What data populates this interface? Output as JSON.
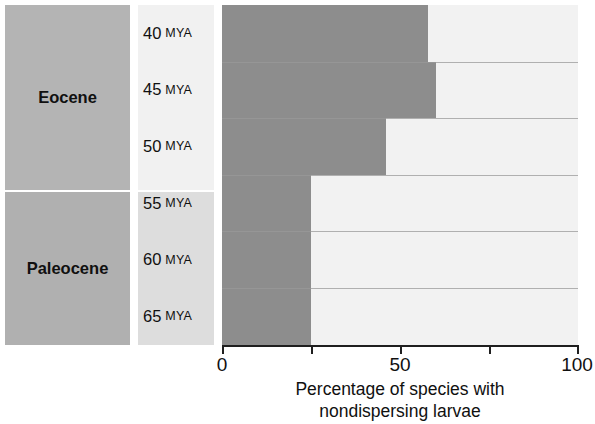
{
  "chart_data": {
    "type": "bar",
    "orientation": "horizontal",
    "title": "",
    "xlabel": "Percentage of species with nondispersing larvae",
    "xlabel_lines": [
      "Percentage of species with",
      "nondispersing larvae"
    ],
    "ylabel": "",
    "categories": [
      "40 MYA",
      "45 MYA",
      "50 MYA",
      "55 MYA",
      "60 MYA",
      "65 MYA"
    ],
    "values": [
      58,
      60,
      46,
      25,
      25,
      25
    ],
    "xlim": [
      0,
      100
    ],
    "xticks": [
      0,
      25,
      50,
      75,
      100
    ],
    "xtick_labels": [
      "0",
      "",
      "50",
      "",
      "100"
    ],
    "grid": false,
    "legend": "none",
    "bar_color": "#8d8d8d",
    "track_color": "#f2f2f2",
    "groups": [
      {
        "label": "Eocene",
        "categories": [
          "40 MYA",
          "45 MYA",
          "50 MYA"
        ]
      },
      {
        "label": "Paleocene",
        "categories": [
          "55 MYA",
          "60 MYA",
          "65 MYA"
        ]
      }
    ]
  },
  "axis": {
    "tick_0": "0",
    "tick_50": "50",
    "tick_100": "100",
    "title_line1": "Percentage of species with",
    "title_line2": "nondispersing larvae"
  },
  "epochs": [
    {
      "label": "Eocene"
    },
    {
      "label": "Paleocene"
    }
  ],
  "rows": [
    {
      "age": "40",
      "unit": "MYA",
      "value": 58
    },
    {
      "age": "45",
      "unit": "MYA",
      "value": 60
    },
    {
      "age": "50",
      "unit": "MYA",
      "value": 46
    },
    {
      "age": "55",
      "unit": "MYA",
      "value": 25
    },
    {
      "age": "60",
      "unit": "MYA",
      "value": 25
    },
    {
      "age": "65",
      "unit": "MYA",
      "value": 25
    }
  ],
  "colors": {
    "bar": "#8d8d8d",
    "track": "#f2f2f2",
    "epoch_band": "#b3b3b3",
    "mya_band_upper": "#f1f1f1",
    "mya_band_lower": "#dddddd",
    "axis": "#1f1f1f"
  }
}
